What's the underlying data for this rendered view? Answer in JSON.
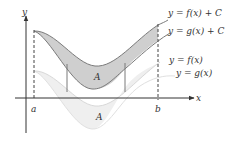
{
  "figure": {
    "axes": {
      "x_label": "x",
      "y_label": "y"
    },
    "bounds": {
      "a_label": "a",
      "b_label": "b"
    },
    "curve_labels": {
      "f_plus_c": "y = f(x) + C",
      "g_plus_c": "y = g(x) + C",
      "f": "y = f(x)",
      "g": "y = g(x)"
    },
    "region_labels": {
      "upper": "A",
      "lower": "A"
    },
    "colors": {
      "upper_fill": "#cfcfcf",
      "upper_stroke": "#7a7a7a",
      "lower_fill": "#efefef",
      "lower_stroke": "#d6d6d6",
      "axis": "#333333"
    }
  }
}
